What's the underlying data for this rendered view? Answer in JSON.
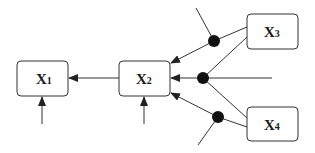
{
  "diagram": {
    "type": "block-diagram",
    "colors": {
      "line": "#333333",
      "box_stroke": "#333333",
      "box_fill": "#ffffff",
      "junction": "#111111",
      "background": "#ffffff"
    },
    "nodes": [
      {
        "id": "x1",
        "label": "X",
        "subscript": "1"
      },
      {
        "id": "x2",
        "label": "X",
        "subscript": "2"
      },
      {
        "id": "x3",
        "label": "X",
        "subscript": "3"
      },
      {
        "id": "x4",
        "label": "X",
        "subscript": "4"
      }
    ],
    "edges": [
      {
        "from": "x2",
        "to": "x1",
        "arrow": true
      },
      {
        "from": "external",
        "to": "x1",
        "arrow": true
      },
      {
        "from": "external",
        "to": "x2",
        "arrow": true
      },
      {
        "from": "x3",
        "to": "x2",
        "via": "junction-1",
        "arrow": true
      },
      {
        "from": "x3",
        "to": "x2",
        "via": "junction-2",
        "arrow": true
      },
      {
        "from": "x4",
        "to": "x2",
        "via": "junction-2",
        "arrow": true
      },
      {
        "from": "x4",
        "to": "x2",
        "via": "junction-3",
        "arrow": true
      }
    ],
    "junctions": [
      {
        "id": "junction-1",
        "has_external_input": true
      },
      {
        "id": "junction-2",
        "has_external_input": true
      },
      {
        "id": "junction-3",
        "has_external_input": true
      }
    ]
  }
}
